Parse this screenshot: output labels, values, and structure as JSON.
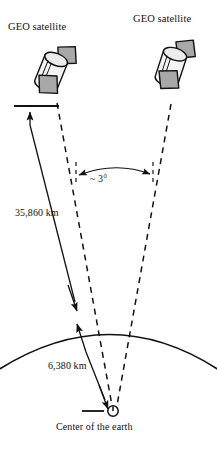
{
  "diagram": {
    "title_left": "GEO satellite",
    "title_right": "GEO satellite",
    "angle_label": "~ 3°",
    "altitude_label": "35,860 km",
    "radius_label": "6,380 km",
    "center_label": "Center of the earth",
    "colors": {
      "line": "#111111",
      "panel_fill": "#a8a8a8",
      "body_fill": "#f2f2f2",
      "background": "#ffffff"
    },
    "icons": {
      "satellite_left": "geo-satellite-icon",
      "satellite_right": "geo-satellite-icon",
      "earth_center": "earth-center-icon",
      "earth_surface": "earth-arc-icon",
      "angle_arrow": "double-headed-arc-arrow-icon",
      "altitude_arrow": "measurement-arrow-icon",
      "radius_arrow": "measurement-arrow-icon"
    }
  }
}
